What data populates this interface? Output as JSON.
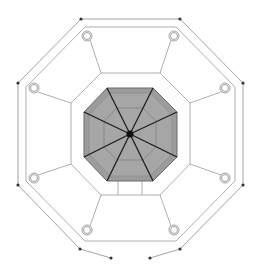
{
  "diagram": {
    "title": "",
    "type": "octagonal floor plan",
    "colors": {
      "background": "#ffffff",
      "line": "#8a8a8a",
      "dark_line": "#222222",
      "fill_center": "#9a9a9a",
      "fill_center_inner": "#a8a8a8",
      "node": "#333333"
    },
    "center": [
      130,
      134
    ],
    "outer_boundary_nodes": [
      [
        81,
        19
      ],
      [
        180,
        19
      ],
      [
        243,
        83
      ],
      [
        243,
        185
      ],
      [
        180,
        249
      ],
      [
        111,
        258
      ],
      [
        150,
        258
      ],
      [
        80,
        249
      ],
      [
        18,
        185
      ],
      [
        18,
        83
      ]
    ],
    "column_circles": [
      [
        87,
        36
      ],
      [
        174,
        36
      ],
      [
        34,
        88
      ],
      [
        225,
        88
      ],
      [
        34,
        178
      ],
      [
        225,
        178
      ],
      [
        87,
        230
      ],
      [
        174,
        230
      ]
    ],
    "entrance_label": ""
  }
}
